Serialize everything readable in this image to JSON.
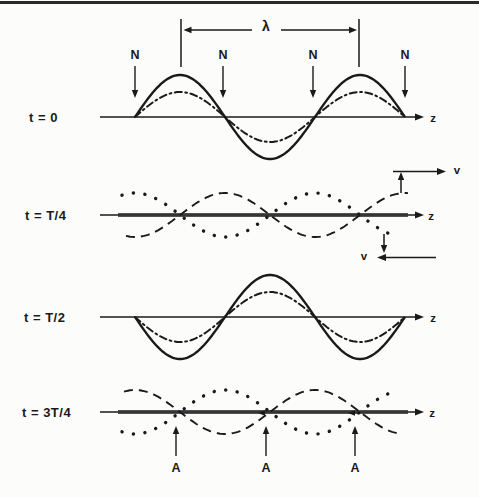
{
  "figure": {
    "type": "standing-wave-superposition-diagram",
    "ink_color": "#1a1a1a",
    "background": "#fcfcfa",
    "axis_label": "z",
    "wavelength_label": "λ",
    "velocity_label": "v",
    "node_label": "N",
    "antinode_label": "A",
    "wavelength_px": 180,
    "first_node_x": 135,
    "sections": [
      {
        "time_label": "t = 0",
        "axis_y": 117,
        "thick_axis": false,
        "node_xs": [
          135,
          223,
          313,
          405
        ],
        "lambda_dim": {
          "x_left": 181,
          "x_right": 359,
          "bar_top": 19,
          "bar_bottom": 67,
          "arrow_y": 30,
          "label_x": 266,
          "label_y": 27
        },
        "waves": [
          {
            "role": "resultant",
            "style": "solid",
            "shape": "sin",
            "sign": -1,
            "amp": 42,
            "x0": 135,
            "x1": 405
          },
          {
            "role": "component-waves-coincident",
            "style": "dashdot",
            "shape": "sin",
            "sign": -1,
            "amp": 25,
            "x0": 135,
            "x1": 405
          }
        ]
      },
      {
        "time_label": "t = T/4",
        "axis_y": 215,
        "thick_axis": true,
        "velocity_arrows": true,
        "waves": [
          {
            "role": "right-moving-wave",
            "style": "dashed",
            "shape": "cos",
            "sign": 1,
            "amp": 22,
            "x0": 126,
            "x1": 409
          },
          {
            "role": "left-moving-wave",
            "style": "dotted",
            "shape": "cos",
            "sign": -1,
            "amp": 22,
            "x0": 122,
            "x1": 399
          }
        ]
      },
      {
        "time_label": "t = T/2",
        "axis_y": 317,
        "thick_axis": false,
        "waves": [
          {
            "role": "resultant",
            "style": "solid",
            "shape": "sin",
            "sign": 1,
            "amp": 42,
            "x0": 135,
            "x1": 405
          },
          {
            "role": "component-waves-coincident",
            "style": "dashdot",
            "shape": "sin",
            "sign": 1,
            "amp": 25,
            "x0": 135,
            "x1": 405
          }
        ]
      },
      {
        "time_label": "t = 3T/4",
        "axis_y": 412,
        "thick_axis": true,
        "antinode_xs": [
          176,
          266,
          355
        ],
        "axis_crossing_arrow_xs": [
          262,
          352
        ],
        "waves": [
          {
            "role": "right-moving-wave",
            "style": "dashed",
            "shape": "cos",
            "sign": -1,
            "amp": 22,
            "x0": 124,
            "x1": 400
          },
          {
            "role": "left-moving-wave",
            "style": "dotted",
            "shape": "cos",
            "sign": 1,
            "amp": 22,
            "x0": 122,
            "x1": 398
          }
        ]
      }
    ]
  }
}
